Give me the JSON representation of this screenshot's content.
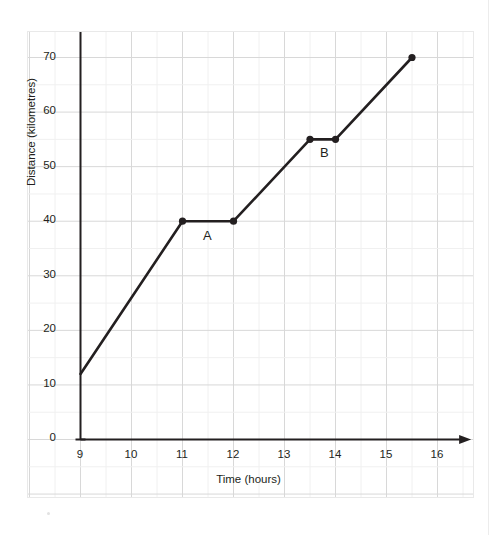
{
  "chart_data": {
    "type": "line",
    "title": "",
    "xlabel": "Time (hours)",
    "ylabel": "Distance (kilometres)",
    "xlim": [
      9,
      16
    ],
    "ylim": [
      0,
      75
    ],
    "xticks": [
      "9",
      "10",
      "11",
      "12",
      "13",
      "14",
      "15",
      "16"
    ],
    "xtick_values": [
      9,
      10,
      11,
      12,
      13,
      14,
      15,
      16
    ],
    "yticks": [
      "0",
      "10",
      "20",
      "30",
      "40",
      "50",
      "60",
      "70"
    ],
    "ytick_values": [
      0,
      10,
      20,
      30,
      40,
      50,
      60,
      70
    ],
    "grid": true,
    "grid_minor_x_step": 0.5,
    "grid_minor_y_step": 5,
    "legend": "none",
    "series": [
      {
        "name": "Journey",
        "x": [
          9,
          11,
          12,
          13.5,
          14,
          15.5
        ],
        "y": [
          12,
          40,
          40,
          55,
          55,
          70
        ],
        "marker_points": [
          {
            "x": 11,
            "y": 40
          },
          {
            "x": 12,
            "y": 40
          },
          {
            "x": 13.5,
            "y": 55
          },
          {
            "x": 14,
            "y": 55
          },
          {
            "x": 15.5,
            "y": 70
          }
        ],
        "color": "#231f20",
        "line_width": 2.6
      }
    ],
    "annotations": [
      {
        "label": "A",
        "x": 11.5,
        "y": 37.0,
        "describes": "flat segment from 11 to 12 at 40 km"
      },
      {
        "label": "B",
        "x": 13.75,
        "y": 51.5,
        "describes": "flat segment from 13.5 to 14 at 55 km"
      }
    ]
  },
  "axis": {
    "x_title": "Time (hours)",
    "y_title": "Distance (kilometres)",
    "x_tick_labels": [
      "9",
      "10",
      "11",
      "12",
      "13",
      "14",
      "15",
      "16"
    ],
    "y_tick_labels": [
      "0",
      "10",
      "20",
      "30",
      "40",
      "50",
      "60",
      "70"
    ]
  },
  "annotations": {
    "a_label": "A",
    "b_label": "B"
  },
  "colors": {
    "line": "#231f20",
    "axis": "#231f20",
    "grid_major": "#d8d8d8",
    "grid_minor": "#f0f0f0",
    "frame": "#e9e9e9",
    "text": "#231f20",
    "background": "#ffffff"
  }
}
